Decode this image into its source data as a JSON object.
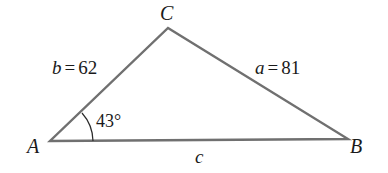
{
  "diagram": {
    "type": "triangle",
    "vertices": {
      "A": {
        "label": "A",
        "x": 50,
        "y": 141
      },
      "B": {
        "label": "B",
        "x": 348,
        "y": 139
      },
      "C": {
        "label": "C",
        "x": 168,
        "y": 28
      }
    },
    "sides": {
      "a": {
        "var": "a",
        "eq": "=",
        "value": "81"
      },
      "b": {
        "var": "b",
        "eq": "=",
        "value": "62"
      },
      "c": {
        "var": "c"
      }
    },
    "angle_A": {
      "value": "43°"
    },
    "colors": {
      "stroke": "#6b6b6b",
      "text": "#1a1a1a",
      "background": "#ffffff"
    }
  }
}
